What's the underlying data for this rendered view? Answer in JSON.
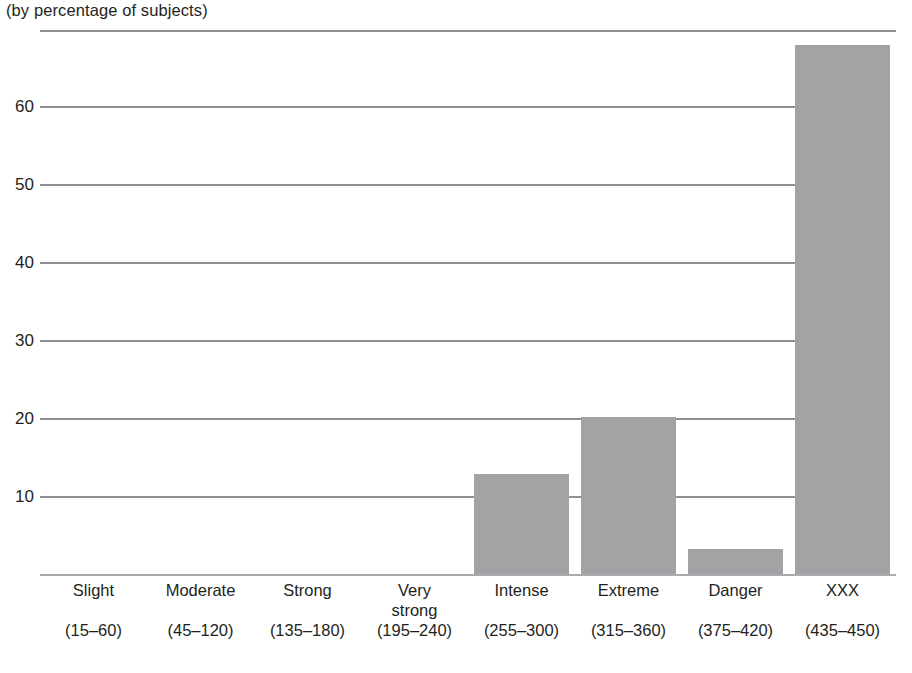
{
  "chart_data": {
    "type": "bar",
    "title": "(by percentage of subjects)",
    "subtitle": "",
    "xlabel": "",
    "ylabel": "",
    "ylim": [
      0,
      68.5
    ],
    "grid": true,
    "legend": null,
    "bar_color": "#a2a3a5",
    "gridline_color": "#8e9093",
    "yticks": [
      10,
      20,
      30,
      40,
      50,
      60
    ],
    "ytick_labels": [
      "10",
      "20",
      "30",
      "40",
      "50",
      "60"
    ],
    "categories": [
      "Slight",
      "Moderate",
      "Strong",
      "Very\nstrong",
      "Intense",
      "Extreme",
      "Danger",
      "XXX"
    ],
    "category_ranges": [
      "(15–60)",
      "(45–120)",
      "(135–180)",
      "(195–240)",
      "(255–300)",
      "(315–360)",
      "(375–420)",
      "(435–450)"
    ],
    "values": [
      0,
      0,
      0,
      0,
      13,
      20.3,
      3.3,
      68
    ]
  },
  "chart": {
    "title": "(by percentage of subjects)",
    "yticks": [
      {
        "label": "60",
        "value": 60
      },
      {
        "label": "50",
        "value": 50
      },
      {
        "label": "40",
        "value": 40
      },
      {
        "label": "30",
        "value": 30
      },
      {
        "label": "20",
        "value": 20
      },
      {
        "label": "10",
        "value": 10
      }
    ],
    "bars": [
      {
        "name": "Slight",
        "range": "(15–60)",
        "value": 0
      },
      {
        "name": "Moderate",
        "range": "(45–120)",
        "value": 0
      },
      {
        "name": "Strong",
        "range": "(135–180)",
        "value": 0
      },
      {
        "name": "Very\nstrong",
        "range": "(195–240)",
        "value": 0
      },
      {
        "name": "Intense",
        "range": "(255–300)",
        "value": 13
      },
      {
        "name": "Extreme",
        "range": "(315–360)",
        "value": 20.3
      },
      {
        "name": "Danger",
        "range": "(375–420)",
        "value": 3.3
      },
      {
        "name": "XXX",
        "range": "(435–450)",
        "value": 68
      }
    ]
  }
}
